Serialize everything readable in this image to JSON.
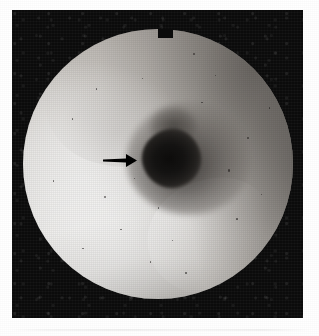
{
  "figure": {
    "kind": "endoscopic-photograph",
    "modality": "flexible endoscopy",
    "view": "circular field of view",
    "page_width": 319,
    "page_height": 336,
    "page_background": "#ffffff"
  },
  "frame": {
    "name": "black photographic border",
    "left": 12,
    "top": 10,
    "width": 291,
    "height": 308,
    "color": "#0b0b0b"
  },
  "field": {
    "name": "circular endoscope field of view",
    "center_x": 158,
    "center_y": 163,
    "radius": 135,
    "left": 23,
    "top": 29,
    "diameter": 270,
    "mask_notch": {
      "name": "rectangular mask notch at top of circle",
      "left": 158,
      "top": 29,
      "width": 15,
      "height": 9
    }
  },
  "tones": {
    "mucosa_highlight": "#f4f3f1",
    "mucosa_mid": "#d9d6d2",
    "mucosa_shadow": "#9b9691",
    "lumen_rim": "#4a4643",
    "lumen_core": "#0d0c0b",
    "border_black": "#0b0b0b",
    "paper_white": "#ffffff"
  },
  "lumen": {
    "name": "central dark lumen / orifice",
    "halo_center_x": 163,
    "halo_center_y": 152,
    "core_center_x": 152,
    "core_center_y": 160,
    "core_width": 30,
    "core_height": 30
  },
  "annotation": {
    "arrow": {
      "name": "pointer arrow indicating the lumen",
      "direction": "right",
      "color": "#000000",
      "tail_x": 103,
      "tip_x": 137,
      "y": 160,
      "shaft_thickness": 4,
      "head_length": 11,
      "head_height": 13
    }
  },
  "specks": [
    {
      "x": 0.63,
      "y": 0.09,
      "d": 2.0
    },
    {
      "x": 0.71,
      "y": 0.17,
      "d": 1.6
    },
    {
      "x": 0.66,
      "y": 0.27,
      "d": 1.5
    },
    {
      "x": 0.83,
      "y": 0.4,
      "d": 1.8
    },
    {
      "x": 0.76,
      "y": 0.52,
      "d": 2.2
    },
    {
      "x": 0.88,
      "y": 0.61,
      "d": 1.6
    },
    {
      "x": 0.79,
      "y": 0.7,
      "d": 1.7
    },
    {
      "x": 0.3,
      "y": 0.62,
      "d": 2.0
    },
    {
      "x": 0.11,
      "y": 0.56,
      "d": 1.8
    },
    {
      "x": 0.36,
      "y": 0.74,
      "d": 1.6
    },
    {
      "x": 0.22,
      "y": 0.81,
      "d": 1.5
    },
    {
      "x": 0.47,
      "y": 0.86,
      "d": 1.6
    },
    {
      "x": 0.55,
      "y": 0.78,
      "d": 1.4
    },
    {
      "x": 0.41,
      "y": 0.55,
      "d": 1.5
    },
    {
      "x": 0.5,
      "y": 0.66,
      "d": 1.4
    },
    {
      "x": 0.18,
      "y": 0.33,
      "d": 1.5
    },
    {
      "x": 0.27,
      "y": 0.22,
      "d": 1.4
    },
    {
      "x": 0.6,
      "y": 0.9,
      "d": 1.5
    },
    {
      "x": 0.91,
      "y": 0.29,
      "d": 1.4
    },
    {
      "x": 0.44,
      "y": 0.18,
      "d": 1.4
    }
  ]
}
